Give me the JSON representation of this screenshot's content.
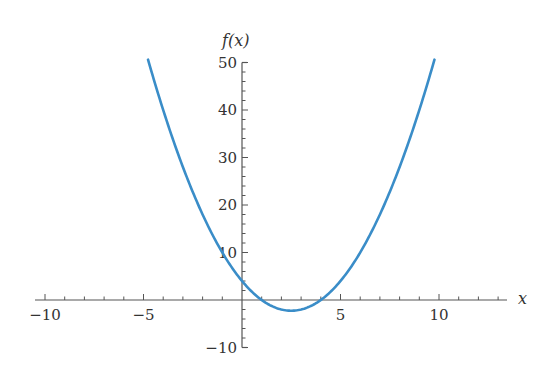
{
  "chart_data": {
    "type": "line",
    "title": "",
    "xlabel": "x",
    "ylabel": "f(x)",
    "function": "x^2 - 5x + 4",
    "xlim": [
      -10.5,
      13.2
    ],
    "ylim": [
      -10,
      50
    ],
    "x_ticks": [
      -10,
      -5,
      5,
      10
    ],
    "x_tick_labels": [
      "−10",
      "−5",
      "5",
      "10"
    ],
    "y_ticks": [
      -10,
      10,
      20,
      30,
      40,
      50
    ],
    "y_tick_labels": [
      "−10",
      "10",
      "20",
      "30",
      "40",
      "50"
    ],
    "series": [
      {
        "name": "f(x)",
        "color": "#3a8dc8",
        "x_range": [
          -4.77,
          9.77
        ],
        "points": [
          [
            -4.77,
            50.0
          ],
          [
            -4,
            40
          ],
          [
            -3,
            28
          ],
          [
            -2,
            18
          ],
          [
            -1,
            10
          ],
          [
            0,
            4
          ],
          [
            1,
            0
          ],
          [
            2,
            -2
          ],
          [
            2.5,
            -2.25
          ],
          [
            3,
            -2
          ],
          [
            4,
            0
          ],
          [
            5,
            4
          ],
          [
            6,
            10
          ],
          [
            7,
            18
          ],
          [
            8,
            28
          ],
          [
            9,
            40
          ],
          [
            9.77,
            50.0
          ]
        ]
      }
    ],
    "grid": false,
    "legend": null
  }
}
